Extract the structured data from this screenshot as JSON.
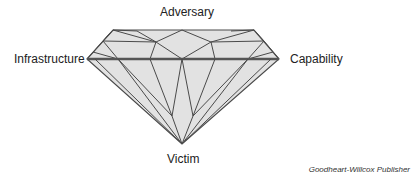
{
  "diagram": {
    "vertices": {
      "top": "Adversary",
      "left": "Infrastructure",
      "right": "Capability",
      "bottom": "Victim"
    },
    "colors": {
      "fill": "#e2e2e2",
      "stroke": "#4a4a4a",
      "girdle": "#555555"
    }
  },
  "credit": "Goodheart-Willcox Publisher"
}
